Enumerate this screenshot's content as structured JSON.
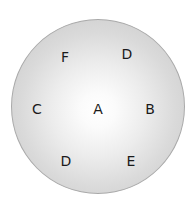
{
  "diagram": {
    "type": "circle-with-labels",
    "colors": {
      "center": "#ffffff",
      "edge": "#c6c6c6",
      "rim": "#a9a9a9",
      "text": "#1a1a1a"
    },
    "labels": [
      {
        "id": "F",
        "text": "F",
        "x": 65,
        "y": 57
      },
      {
        "id": "D-top",
        "text": "D",
        "x": 127,
        "y": 54
      },
      {
        "id": "C",
        "text": "C",
        "x": 37,
        "y": 109
      },
      {
        "id": "A",
        "text": "A",
        "x": 98,
        "y": 109
      },
      {
        "id": "B",
        "text": "B",
        "x": 150,
        "y": 109
      },
      {
        "id": "D-bottom",
        "text": "D",
        "x": 66,
        "y": 161
      },
      {
        "id": "E",
        "text": "E",
        "x": 131,
        "y": 161
      }
    ]
  }
}
